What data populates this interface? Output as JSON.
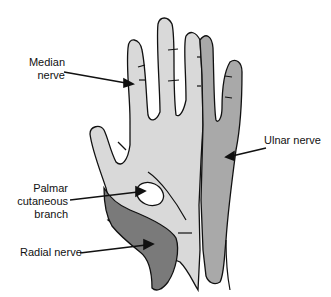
{
  "diagram": {
    "labels": {
      "median": "Median\nnerve",
      "ulnar": "Ulnar nerve",
      "palmar": "Palmar\ncutaneous\nbranch",
      "radial": "Radial nerve"
    },
    "colors": {
      "median_region": "#d9d9d9",
      "ulnar_region": "#a9a9a9",
      "radial_region": "#7a7a7a",
      "palmar_branch_region": "#ffffff",
      "outline": "#111111"
    }
  }
}
